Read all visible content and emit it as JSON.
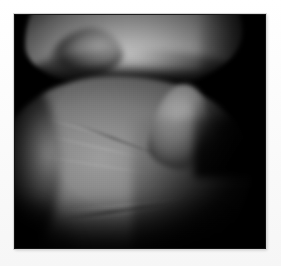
{
  "page": {
    "background_color": "#fdfdfd",
    "width": 281,
    "height": 266,
    "alt_text": ""
  },
  "figure": {
    "name": "arthroscopic-knee-image",
    "frame": {
      "left": 14,
      "top": 14,
      "width": 252,
      "height": 235,
      "background_color": "#000000",
      "border_color": "#141414"
    },
    "caption": "",
    "label": "",
    "annotations": []
  },
  "colors": {
    "margin": "#fdfdfd",
    "frame_background": "#000000",
    "highlight": "#d2d2d2",
    "midtone": "#8d8d8d",
    "shadow": "#3a3a3a",
    "black": "#000000"
  },
  "structures": [
    {
      "id": "femoral-condyle",
      "label": "",
      "region": "upper",
      "brightness": "high",
      "description": ""
    },
    {
      "id": "joint-space",
      "label": "",
      "region": "middle",
      "brightness": "none",
      "description": ""
    },
    {
      "id": "tibial-plateau",
      "label": "",
      "region": "lower",
      "brightness": "medium",
      "description": ""
    },
    {
      "id": "central-apex",
      "label": "",
      "region": "lower-center",
      "brightness": "medium-high",
      "description": ""
    }
  ]
}
